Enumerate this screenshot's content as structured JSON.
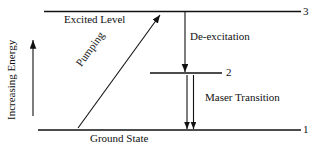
{
  "diagram": {
    "axis": {
      "label": "Increasing Energy",
      "arrow_direction": "up"
    },
    "levels": [
      {
        "id": "level-3",
        "number": "3",
        "name": "Excited Level"
      },
      {
        "id": "level-2",
        "number": "2",
        "name": ""
      },
      {
        "id": "level-1",
        "number": "1",
        "name": "Ground State"
      }
    ],
    "transitions": [
      {
        "id": "pumping",
        "label": "Pumping",
        "direction": "up",
        "from": "1",
        "to": "3"
      },
      {
        "id": "de-excitation",
        "label": "De-excitation",
        "direction": "down",
        "from": "3",
        "to": "2"
      },
      {
        "id": "maser-transition",
        "label": "Maser Transition",
        "direction": "down",
        "from": "2",
        "to": "1"
      }
    ],
    "colors": {
      "ink": "#111111",
      "background": "#ffffff"
    }
  }
}
